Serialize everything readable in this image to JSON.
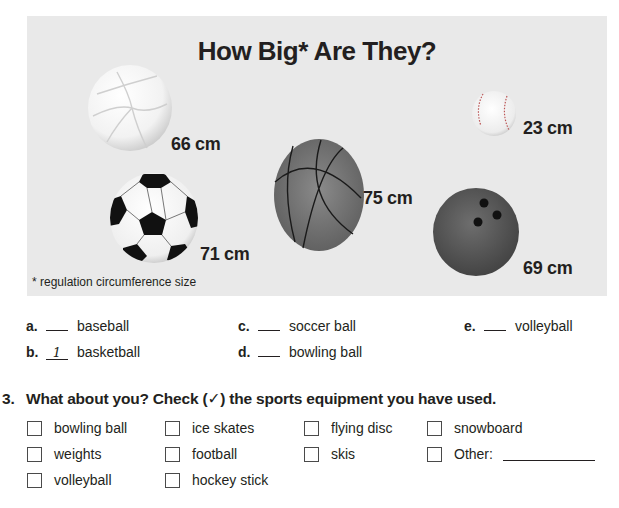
{
  "infographic": {
    "title": "How Big* Are They?",
    "footnote": "* regulation circumference size",
    "background_color": "#e9e9e9",
    "balls": [
      {
        "name": "volleyball",
        "size": "66 cm"
      },
      {
        "name": "soccer ball",
        "size": "71 cm"
      },
      {
        "name": "basketball",
        "size": "75 cm"
      },
      {
        "name": "baseball",
        "size": "23 cm"
      },
      {
        "name": "bowling ball",
        "size": "69 cm"
      }
    ]
  },
  "matching": {
    "items": [
      {
        "letter": "a.",
        "answer": "",
        "label": "baseball"
      },
      {
        "letter": "b.",
        "answer": "1",
        "label": "basketball"
      },
      {
        "letter": "c.",
        "answer": "",
        "label": "soccer ball"
      },
      {
        "letter": "d.",
        "answer": "",
        "label": "bowling ball"
      },
      {
        "letter": "e.",
        "answer": "",
        "label": "volleyball"
      }
    ]
  },
  "question3": {
    "number": "3.",
    "text": "What about you? Check (✓) the sports equipment you have used.",
    "options": [
      {
        "label": "bowling ball",
        "checked": false
      },
      {
        "label": "weights",
        "checked": false
      },
      {
        "label": "volleyball",
        "checked": false
      },
      {
        "label": "ice skates",
        "checked": false
      },
      {
        "label": "football",
        "checked": false
      },
      {
        "label": "hockey stick",
        "checked": false
      },
      {
        "label": "flying disc",
        "checked": false
      },
      {
        "label": "skis",
        "checked": false
      },
      {
        "label": "snowboard",
        "checked": false
      },
      {
        "label": "Other:",
        "checked": false,
        "value": ""
      }
    ]
  }
}
